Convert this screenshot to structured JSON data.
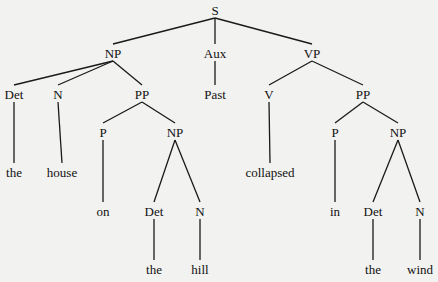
{
  "diagram": {
    "type": "syntax-tree",
    "sentence": "the house on the hill collapsed in the wind",
    "nodes": {
      "s": {
        "label": "S",
        "x": 215,
        "y": 10
      },
      "np1": {
        "label": "NP",
        "x": 113,
        "y": 53
      },
      "aux": {
        "label": "Aux",
        "x": 215,
        "y": 53
      },
      "vp": {
        "label": "VP",
        "x": 312,
        "y": 53
      },
      "det1": {
        "label": "Det",
        "x": 14,
        "y": 94
      },
      "n1": {
        "label": "N",
        "x": 58,
        "y": 94
      },
      "pp1": {
        "label": "PP",
        "x": 142,
        "y": 94
      },
      "past": {
        "label": "Past",
        "x": 215,
        "y": 94
      },
      "v": {
        "label": "V",
        "x": 269,
        "y": 94
      },
      "pp2": {
        "label": "PP",
        "x": 363,
        "y": 94
      },
      "w_the1": {
        "label": "the",
        "x": 14,
        "y": 172
      },
      "w_house": {
        "label": "house",
        "x": 62,
        "y": 172
      },
      "p1": {
        "label": "P",
        "x": 103,
        "y": 132
      },
      "np2": {
        "label": "NP",
        "x": 175,
        "y": 132
      },
      "w_collapsed": {
        "label": "collapsed",
        "x": 270,
        "y": 172
      },
      "p2": {
        "label": "P",
        "x": 335,
        "y": 132
      },
      "np3": {
        "label": "NP",
        "x": 398,
        "y": 132
      },
      "w_on": {
        "label": "on",
        "x": 103,
        "y": 211
      },
      "det2": {
        "label": "Det",
        "x": 154,
        "y": 211
      },
      "n2": {
        "label": "N",
        "x": 200,
        "y": 211
      },
      "w_in": {
        "label": "in",
        "x": 335,
        "y": 211
      },
      "det3": {
        "label": "Det",
        "x": 373,
        "y": 211
      },
      "n3": {
        "label": "N",
        "x": 420,
        "y": 211
      },
      "w_the2": {
        "label": "the",
        "x": 154,
        "y": 269
      },
      "w_hill": {
        "label": "hill",
        "x": 200,
        "y": 269
      },
      "w_the3": {
        "label": "the",
        "x": 373,
        "y": 269
      },
      "w_wind": {
        "label": "wind",
        "x": 420,
        "y": 269
      }
    },
    "edges": [
      [
        "s",
        "np1"
      ],
      [
        "s",
        "aux"
      ],
      [
        "s",
        "vp"
      ],
      [
        "np1",
        "det1"
      ],
      [
        "np1",
        "n1"
      ],
      [
        "np1",
        "pp1"
      ],
      [
        "aux",
        "past"
      ],
      [
        "vp",
        "v"
      ],
      [
        "vp",
        "pp2"
      ],
      [
        "det1",
        "w_the1"
      ],
      [
        "n1",
        "w_house"
      ],
      [
        "pp1",
        "p1"
      ],
      [
        "pp1",
        "np2"
      ],
      [
        "v",
        "w_collapsed"
      ],
      [
        "pp2",
        "p2"
      ],
      [
        "pp2",
        "np3"
      ],
      [
        "p1",
        "w_on"
      ],
      [
        "np2",
        "det2"
      ],
      [
        "np2",
        "n2"
      ],
      [
        "p2",
        "w_in"
      ],
      [
        "np3",
        "det3"
      ],
      [
        "np3",
        "n3"
      ],
      [
        "det2",
        "w_the2"
      ],
      [
        "n2",
        "w_hill"
      ],
      [
        "det3",
        "w_the3"
      ],
      [
        "n3",
        "w_wind"
      ]
    ]
  }
}
